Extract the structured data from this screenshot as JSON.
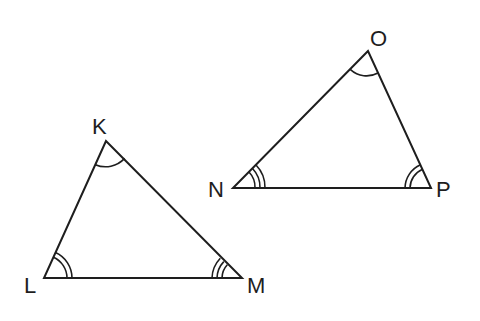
{
  "figure": {
    "line_color": "#1e1e1e",
    "background": "#ffffff"
  },
  "triangles": [
    {
      "name": "KLM",
      "vertices": [
        {
          "label": "K",
          "x": 106,
          "y": 141,
          "arcs": 1
        },
        {
          "label": "L",
          "x": 44,
          "y": 278,
          "arcs": 2
        },
        {
          "label": "M",
          "x": 242,
          "y": 278,
          "arcs": 3
        }
      ]
    },
    {
      "name": "ONP",
      "vertices": [
        {
          "label": "O",
          "x": 368,
          "y": 51,
          "arcs": 1
        },
        {
          "label": "N",
          "x": 233,
          "y": 188,
          "arcs": 3
        },
        {
          "label": "P",
          "x": 431,
          "y": 188,
          "arcs": 2
        }
      ]
    }
  ],
  "labels": {
    "K": "K",
    "L": "L",
    "M": "M",
    "O": "O",
    "N": "N",
    "P": "P"
  }
}
